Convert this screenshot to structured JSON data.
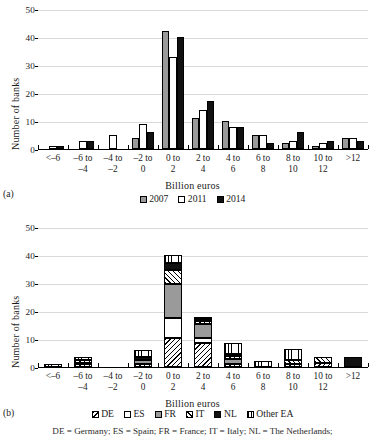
{
  "figure": {
    "panel_a_letter": "(a)",
    "panel_b_letter": "(b)",
    "footnote": "DE = Germany; ES = Spain; FR = France; IT = Italy; NL = The Netherlands;"
  },
  "axes": {
    "ylabel": "Number of banks",
    "xlabel": "Billion euros",
    "yticks": [
      "0",
      "10",
      "20",
      "30",
      "40",
      "50"
    ],
    "categories": [
      "<–6",
      "–6 to\n–4",
      "–4 to\n–2",
      "–2 to\n0",
      "0 to\n2",
      "2 to\n4",
      "4 to\n6",
      "6 to\n8",
      "8 to\n10",
      "10 to\n12",
      ">12"
    ]
  },
  "legend_a": {
    "items": [
      {
        "label": "2007",
        "fill": "gray",
        "color": "#9a9a9a"
      },
      {
        "label": "2011",
        "fill": "white",
        "color": "#ffffff"
      },
      {
        "label": "2014",
        "fill": "black",
        "color": "#111111"
      }
    ]
  },
  "legend_b": {
    "items": [
      {
        "label": "DE",
        "fill": "diag2",
        "color": "#ffffff"
      },
      {
        "label": "ES",
        "fill": "white",
        "color": "#ffffff"
      },
      {
        "label": "FR",
        "fill": "gray",
        "color": "#9a9a9a"
      },
      {
        "label": "IT",
        "fill": "diag",
        "color": "#ffffff"
      },
      {
        "label": "NL",
        "fill": "black",
        "color": "#111111"
      },
      {
        "label": "Other EA",
        "fill": "vert",
        "color": "#ffffff"
      }
    ]
  },
  "chart_data": [
    {
      "type": "bar",
      "id": "panel-a",
      "title": "",
      "xlabel": "Billion euros",
      "ylabel": "Number of banks",
      "ylim": [
        0,
        50
      ],
      "yticks": [
        0,
        10,
        20,
        30,
        40,
        50
      ],
      "grid": true,
      "legend_position": "bottom",
      "categories": [
        "<–6",
        "–6 to –4",
        "–4 to –2",
        "–2 to 0",
        "0 to 2",
        "2 to 4",
        "4 to 6",
        "6 to 8",
        "8 to 10",
        "10 to 12",
        ">12"
      ],
      "series": [
        {
          "name": "2007",
          "values": [
            0,
            0,
            0,
            4,
            42,
            11,
            10,
            5,
            2,
            1,
            4
          ]
        },
        {
          "name": "2011",
          "values": [
            1,
            3,
            5,
            9,
            33,
            14,
            8,
            5,
            3,
            2,
            4
          ]
        },
        {
          "name": "2014",
          "values": [
            1,
            3,
            0,
            6,
            40,
            17,
            8,
            2,
            6,
            3,
            3
          ]
        }
      ]
    },
    {
      "type": "bar",
      "id": "panel-b",
      "stacked": true,
      "title": "",
      "xlabel": "Billion euros",
      "ylabel": "Number of banks",
      "ylim": [
        0,
        50
      ],
      "yticks": [
        0,
        10,
        20,
        30,
        40,
        50
      ],
      "grid": true,
      "legend_position": "bottom",
      "categories": [
        "<–6",
        "–6 to –4",
        "–4 to –2",
        "–2 to 0",
        "0 to 2",
        "2 to 4",
        "4 to 6",
        "6 to 8",
        "8 to 10",
        "10 to 12",
        ">12"
      ],
      "series": [
        {
          "name": "DE",
          "values": [
            0,
            1,
            0,
            1,
            10.5,
            8.5,
            1,
            0,
            1,
            1.5,
            0
          ]
        },
        {
          "name": "ES",
          "values": [
            0,
            0,
            0,
            0,
            7,
            2,
            0,
            0,
            0,
            0,
            0
          ]
        },
        {
          "name": "FR",
          "values": [
            0,
            0.5,
            0,
            1.5,
            12,
            5,
            2,
            0,
            0,
            0,
            0
          ]
        },
        {
          "name": "IT",
          "values": [
            0,
            1,
            0,
            0,
            5,
            1,
            1,
            0,
            1.5,
            2,
            0
          ]
        },
        {
          "name": "NL",
          "values": [
            0,
            0,
            0,
            1,
            2.5,
            0.5,
            0.5,
            0,
            0,
            0,
            3.5
          ]
        },
        {
          "name": "Other EA",
          "values": [
            1.2,
            1,
            0,
            2.5,
            3,
            0.5,
            4,
            2,
            4,
            0,
            0
          ]
        }
      ],
      "totals": [
        1.2,
        3.5,
        0,
        6,
        40,
        17.5,
        8.5,
        2,
        6.5,
        3.5,
        3.5
      ]
    }
  ]
}
